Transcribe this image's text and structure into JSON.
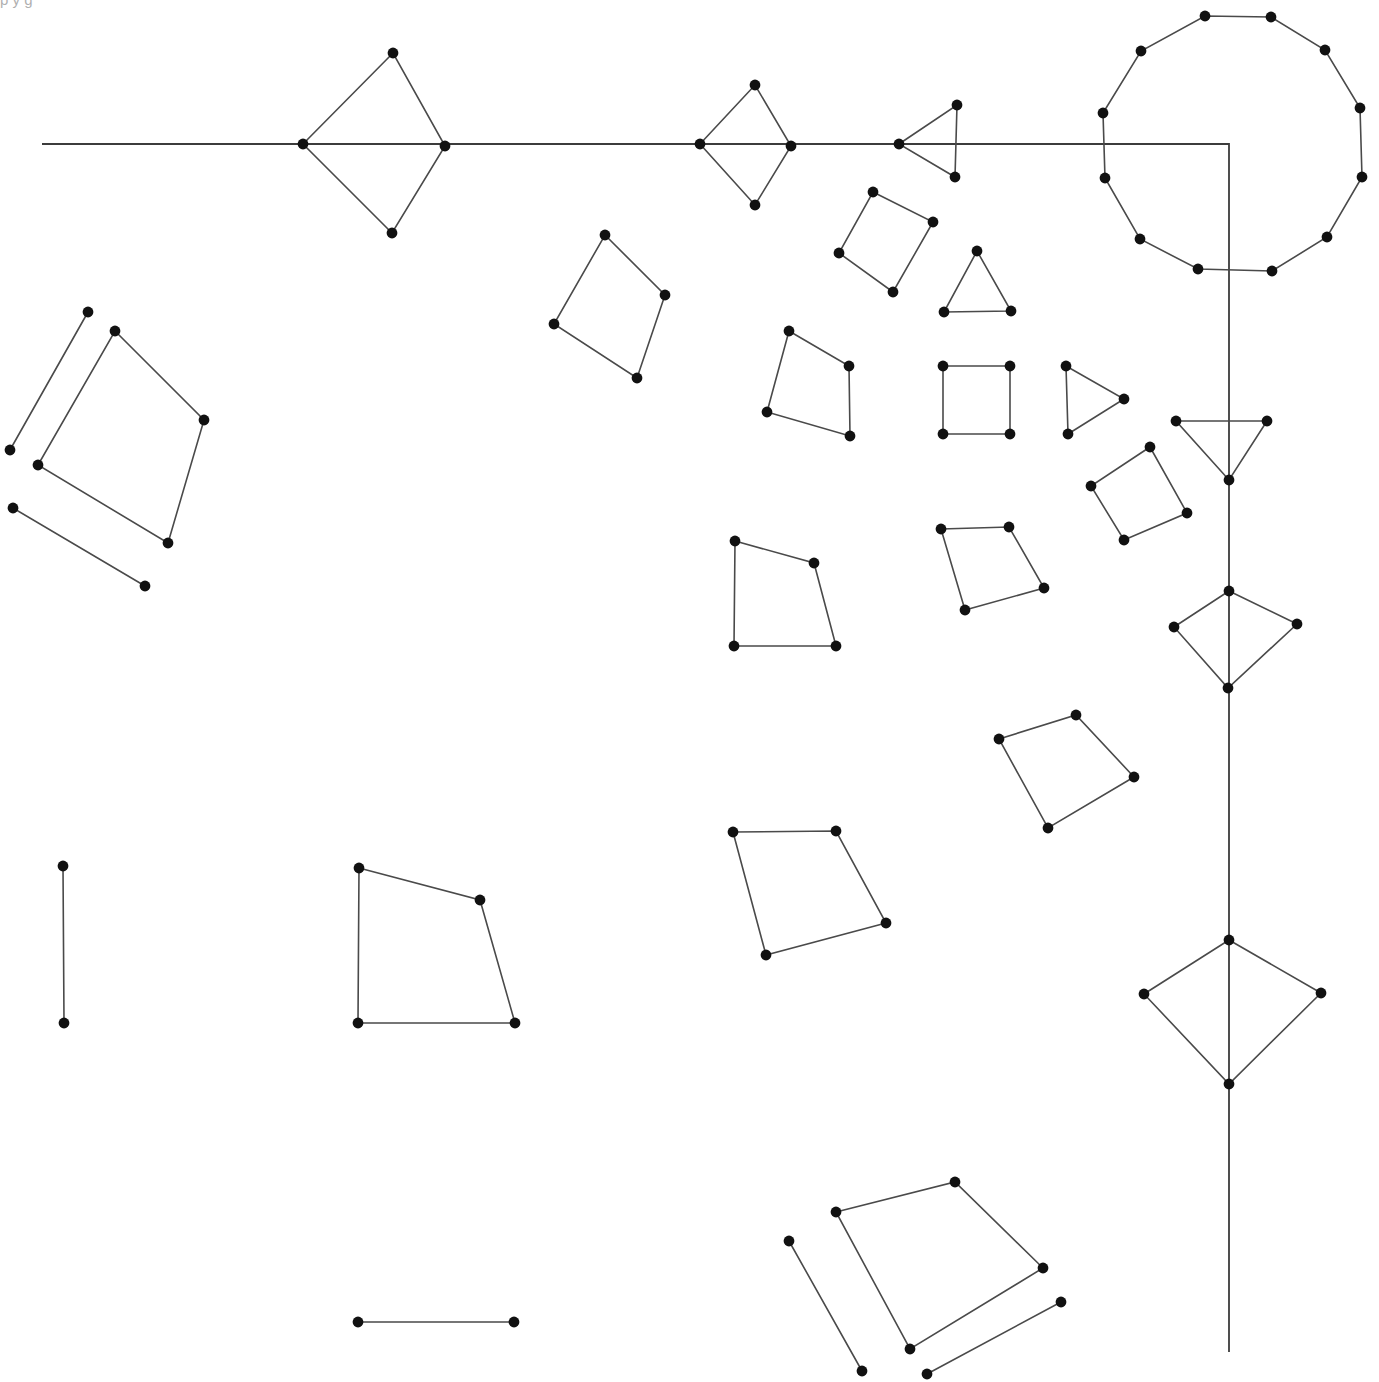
{
  "canvas": {
    "width": 1379,
    "height": 1382,
    "background": "#ffffff",
    "node_color": "#111111",
    "edge_color": "#4a4a4a",
    "axis_color": "#3c3c3c",
    "node_radius": 5.4
  },
  "caption": {
    "text": "p y g",
    "note": "partially cropped text at top edge"
  },
  "chart_data": {
    "type": "scatter",
    "title": "",
    "subtitle": "",
    "xlabel": "",
    "ylabel": "",
    "xlim": [
      0,
      1379
    ],
    "ylim": [
      0,
      1382
    ],
    "grid": false,
    "legend": null,
    "counts": {
      "nodes": 108,
      "polygons": 22,
      "open_segments": 7,
      "polylines": 1
    },
    "shapes": [
      {
        "id": "axis-polyline",
        "kind": "polyline",
        "closed": false,
        "points": [
          [
            42,
            144
          ],
          [
            1229,
            144
          ],
          [
            1229,
            1352
          ]
        ]
      },
      {
        "id": "diamond-axis-1",
        "kind": "polygon",
        "closed": true,
        "points": [
          [
            303,
            144
          ],
          [
            393,
            53
          ],
          [
            445,
            146
          ],
          [
            392,
            233
          ]
        ]
      },
      {
        "id": "diamond-axis-2",
        "kind": "polygon",
        "closed": true,
        "points": [
          [
            700,
            144
          ],
          [
            755,
            85
          ],
          [
            791,
            146
          ],
          [
            755,
            205
          ]
        ]
      },
      {
        "id": "triangle-axis-3",
        "kind": "polygon",
        "closed": true,
        "points": [
          [
            899,
            144
          ],
          [
            957,
            105
          ],
          [
            955,
            177
          ]
        ]
      },
      {
        "id": "dodecagon",
        "kind": "polygon",
        "closed": true,
        "points": [
          [
            1205,
            16
          ],
          [
            1271,
            17
          ],
          [
            1325,
            50
          ],
          [
            1360,
            108
          ],
          [
            1362,
            177
          ],
          [
            1327,
            237
          ],
          [
            1272,
            271
          ],
          [
            1198,
            269
          ],
          [
            1140,
            239
          ],
          [
            1105,
            178
          ],
          [
            1103,
            113
          ],
          [
            1141,
            51
          ]
        ]
      },
      {
        "id": "quad-topleft",
        "kind": "polygon",
        "closed": true,
        "points": [
          [
            115,
            331
          ],
          [
            204,
            420
          ],
          [
            168,
            543
          ],
          [
            38,
            465
          ]
        ]
      },
      {
        "id": "segment-topleft-a",
        "kind": "polyline",
        "closed": false,
        "points": [
          [
            88,
            312
          ],
          [
            10,
            450
          ]
        ]
      },
      {
        "id": "segment-topleft-b",
        "kind": "polyline",
        "closed": false,
        "points": [
          [
            13,
            508
          ],
          [
            145,
            586
          ]
        ]
      },
      {
        "id": "quad-mid-upper-1",
        "kind": "polygon",
        "closed": true,
        "points": [
          [
            605,
            235
          ],
          [
            665,
            295
          ],
          [
            637,
            378
          ],
          [
            554,
            324
          ]
        ]
      },
      {
        "id": "quad-mid-upper-2",
        "kind": "polygon",
        "closed": true,
        "points": [
          [
            873,
            192
          ],
          [
            933,
            222
          ],
          [
            893,
            292
          ],
          [
            839,
            253
          ]
        ]
      },
      {
        "id": "triangle-small-1",
        "kind": "polygon",
        "closed": true,
        "points": [
          [
            977,
            251
          ],
          [
            1011,
            311
          ],
          [
            944,
            312
          ]
        ]
      },
      {
        "id": "quad-mid-3",
        "kind": "polygon",
        "closed": true,
        "points": [
          [
            789,
            331
          ],
          [
            849,
            366
          ],
          [
            850,
            436
          ],
          [
            767,
            412
          ]
        ]
      },
      {
        "id": "square-axis-aligned",
        "kind": "polygon",
        "closed": true,
        "points": [
          [
            943,
            366
          ],
          [
            1010,
            366
          ],
          [
            1010,
            434
          ],
          [
            943,
            434
          ]
        ]
      },
      {
        "id": "triangle-small-2",
        "kind": "polygon",
        "closed": true,
        "points": [
          [
            1066,
            366
          ],
          [
            1124,
            399
          ],
          [
            1068,
            434
          ]
        ]
      },
      {
        "id": "quad-right-1",
        "kind": "polygon",
        "closed": true,
        "points": [
          [
            1150,
            447
          ],
          [
            1187,
            513
          ],
          [
            1124,
            540
          ],
          [
            1091,
            486
          ]
        ]
      },
      {
        "id": "triangle-vertical-axis",
        "kind": "polygon",
        "closed": true,
        "points": [
          [
            1176,
            421
          ],
          [
            1267,
            421
          ],
          [
            1229,
            480
          ]
        ]
      },
      {
        "id": "quad-mid-4",
        "kind": "polygon",
        "closed": true,
        "points": [
          [
            735,
            541
          ],
          [
            814,
            563
          ],
          [
            836,
            646
          ],
          [
            734,
            646
          ]
        ]
      },
      {
        "id": "quad-mid-5",
        "kind": "polygon",
        "closed": true,
        "points": [
          [
            941,
            529
          ],
          [
            1009,
            527
          ],
          [
            1044,
            588
          ],
          [
            965,
            610
          ]
        ]
      },
      {
        "id": "diamond-vertical-1",
        "kind": "polygon",
        "closed": true,
        "points": [
          [
            1229,
            591
          ],
          [
            1297,
            624
          ],
          [
            1228,
            688
          ],
          [
            1174,
            627
          ]
        ]
      },
      {
        "id": "quad-mid-6",
        "kind": "polygon",
        "closed": true,
        "points": [
          [
            999,
            739
          ],
          [
            1076,
            715
          ],
          [
            1134,
            777
          ],
          [
            1048,
            828
          ]
        ]
      },
      {
        "id": "quad-mid-7",
        "kind": "polygon",
        "closed": true,
        "points": [
          [
            733,
            832
          ],
          [
            836,
            831
          ],
          [
            886,
            923
          ],
          [
            766,
            955
          ]
        ]
      },
      {
        "id": "quad-left-lower",
        "kind": "polygon",
        "closed": true,
        "points": [
          [
            359,
            868
          ],
          [
            480,
            900
          ],
          [
            515,
            1023
          ],
          [
            358,
            1023
          ]
        ]
      },
      {
        "id": "segment-left-vertical",
        "kind": "polyline",
        "closed": false,
        "points": [
          [
            63,
            866
          ],
          [
            64,
            1023
          ]
        ]
      },
      {
        "id": "diamond-vertical-2",
        "kind": "polygon",
        "closed": true,
        "points": [
          [
            1229,
            940
          ],
          [
            1321,
            993
          ],
          [
            1229,
            1084
          ],
          [
            1144,
            994
          ]
        ]
      },
      {
        "id": "segment-bottom-left",
        "kind": "polyline",
        "closed": false,
        "points": [
          [
            358,
            1322
          ],
          [
            514,
            1322
          ]
        ]
      },
      {
        "id": "quad-bottom-right",
        "kind": "polygon",
        "closed": true,
        "points": [
          [
            836,
            1212
          ],
          [
            955,
            1182
          ],
          [
            1043,
            1268
          ],
          [
            910,
            1349
          ]
        ]
      },
      {
        "id": "segment-bottom-a",
        "kind": "polyline",
        "closed": false,
        "points": [
          [
            789,
            1241
          ],
          [
            862,
            1371
          ]
        ]
      },
      {
        "id": "segment-bottom-b",
        "kind": "polyline",
        "closed": false,
        "points": [
          [
            1061,
            1302
          ],
          [
            927,
            1374
          ]
        ]
      }
    ]
  }
}
